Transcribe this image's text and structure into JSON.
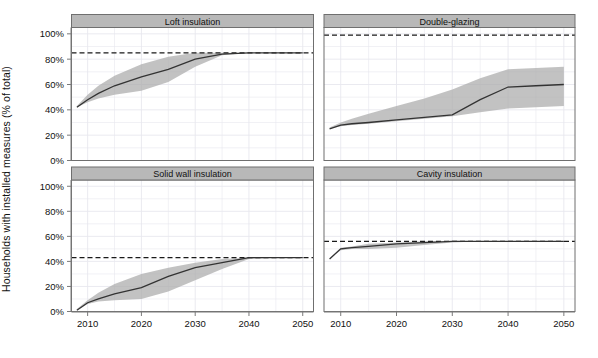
{
  "figure": {
    "ylabel": "Households with installed measures (% of total)",
    "xlabel": "",
    "width": 598,
    "height": 358,
    "panel_fill": "#ffffff",
    "strip_fill": "#b8b8b8",
    "ribbon_fill": "#aaaaaa",
    "line_color": "#333333",
    "grid_color": "#e8e8ee",
    "axis_color": "#7a7a7a"
  },
  "chart_data": {
    "type": "line",
    "title": "",
    "xlabel": "",
    "ylabel": "Households with installed measures (% of total)",
    "xlim": [
      2007,
      2052
    ],
    "ylim": [
      0,
      105
    ],
    "grid": true,
    "legend": "none",
    "xticks": [
      2010,
      2020,
      2030,
      2040,
      2050
    ],
    "xticklabels": [
      "2010",
      "2020",
      "2030",
      "2040",
      "2050"
    ],
    "yticks": [
      0,
      20,
      40,
      60,
      80,
      100
    ],
    "yticklabels": [
      "0%",
      "20%",
      "40%",
      "60%",
      "80%",
      "100%"
    ],
    "layout": "2x2 faceted panels, shared axes, strip titles on top of each panel",
    "panels": [
      {
        "name": "Loft insulation",
        "row": 0,
        "col": 0,
        "reference_line": 85,
        "reference_line_style": "dashed",
        "series": [
          {
            "name": "central",
            "x": [
              2008,
              2010,
              2012,
              2015,
              2020,
              2025,
              2030,
              2035,
              2040,
              2045,
              2050
            ],
            "values": [
              42,
              48,
              53,
              59,
              66,
              72,
              80,
              84,
              85,
              85,
              85
            ]
          },
          {
            "name": "upper",
            "x": [
              2008,
              2010,
              2012,
              2015,
              2020,
              2025,
              2030,
              2035,
              2040,
              2045,
              2050
            ],
            "values": [
              43,
              52,
              59,
              67,
              76,
              82,
              85,
              85,
              85,
              85,
              85
            ]
          },
          {
            "name": "lower",
            "x": [
              2008,
              2010,
              2012,
              2015,
              2020,
              2025,
              2030,
              2035,
              2040,
              2045,
              2050
            ],
            "values": [
              42,
              46,
              49,
              52,
              55,
              62,
              74,
              83,
              85,
              85,
              85
            ]
          }
        ]
      },
      {
        "name": "Double-glazing",
        "row": 0,
        "col": 1,
        "reference_line": 99,
        "reference_line_style": "dashed",
        "series": [
          {
            "name": "central",
            "x": [
              2008,
              2010,
              2012,
              2015,
              2020,
              2025,
              2030,
              2035,
              2040,
              2045,
              2050
            ],
            "values": [
              25,
              28,
              29,
              30,
              32,
              34,
              36,
              48,
              58,
              59,
              60
            ]
          },
          {
            "name": "upper",
            "x": [
              2008,
              2010,
              2012,
              2015,
              2020,
              2025,
              2030,
              2035,
              2040,
              2045,
              2050
            ],
            "values": [
              26,
              30,
              33,
              37,
              43,
              49,
              56,
              65,
              72,
              73,
              74
            ]
          },
          {
            "name": "lower",
            "x": [
              2008,
              2010,
              2012,
              2015,
              2020,
              2025,
              2030,
              2035,
              2040,
              2045,
              2050
            ],
            "values": [
              25,
              27,
              28,
              29,
              31,
              33,
              35,
              38,
              41,
              42,
              43
            ]
          }
        ]
      },
      {
        "name": "Solid wall insulation",
        "row": 1,
        "col": 0,
        "reference_line": 43,
        "reference_line_style": "dashed",
        "series": [
          {
            "name": "central",
            "x": [
              2008,
              2010,
              2012,
              2015,
              2020,
              2025,
              2030,
              2035,
              2040,
              2045,
              2050
            ],
            "values": [
              1,
              7,
              10,
              14,
              19,
              28,
              35,
              39,
              43,
              43,
              43
            ]
          },
          {
            "name": "upper",
            "x": [
              2008,
              2010,
              2012,
              2015,
              2020,
              2025,
              2030,
              2035,
              2040,
              2045,
              2050
            ],
            "values": [
              2,
              9,
              15,
              22,
              30,
              35,
              39,
              42,
              43,
              43,
              43
            ]
          },
          {
            "name": "lower",
            "x": [
              2008,
              2010,
              2012,
              2015,
              2020,
              2025,
              2030,
              2035,
              2040,
              2045,
              2050
            ],
            "values": [
              1,
              6,
              8,
              9,
              10,
              16,
              25,
              34,
              42,
              43,
              43
            ]
          }
        ]
      },
      {
        "name": "Cavity insulation",
        "row": 1,
        "col": 1,
        "reference_line": 56,
        "reference_line_style": "dashed",
        "series": [
          {
            "name": "central",
            "x": [
              2008,
              2010,
              2012,
              2015,
              2020,
              2025,
              2030,
              2035,
              2040,
              2045,
              2050
            ],
            "values": [
              42,
              50,
              51,
              52,
              54,
              55,
              56,
              56,
              56,
              56,
              56
            ]
          },
          {
            "name": "upper",
            "x": [
              2008,
              2010,
              2012,
              2015,
              2020,
              2025,
              2030,
              2035,
              2040,
              2045,
              2050
            ],
            "values": [
              42,
              51,
              52,
              54,
              55,
              56,
              56,
              56,
              56,
              56,
              56
            ]
          },
          {
            "name": "lower",
            "x": [
              2008,
              2010,
              2012,
              2015,
              2020,
              2025,
              2030,
              2035,
              2040,
              2045,
              2050
            ],
            "values": [
              42,
              49,
              50,
              50,
              51,
              53,
              55,
              56,
              56,
              56,
              56
            ]
          }
        ]
      }
    ]
  }
}
